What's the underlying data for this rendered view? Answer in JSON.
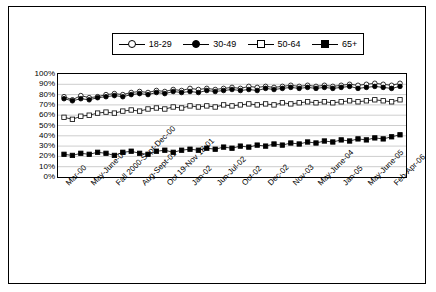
{
  "chart_data": {
    "type": "line",
    "title": "",
    "xlabel": "",
    "ylabel": "",
    "ylim": [
      0,
      100
    ],
    "ytick_labels": [
      "100%",
      "90%",
      "80%",
      "70%",
      "60%",
      "50%",
      "40%",
      "30%",
      "20%",
      "10%",
      "0%"
    ],
    "yticks": [
      100,
      90,
      80,
      70,
      60,
      50,
      40,
      30,
      20,
      10,
      0
    ],
    "grid": true,
    "legend_position": "top",
    "legend": [
      "18-29",
      "30-49",
      "50-64",
      "65+"
    ],
    "x_tick_labels": [
      "Mar-00",
      "May-June-00",
      "Fall 2000-Sept-Dec-00",
      "Aug-Sept-01",
      "Oct 19-Nov 18-01",
      "Jan-02",
      "Jun-Jul-02",
      "Oct-02",
      "Dec-02",
      "Nov-03",
      "May-June-04",
      "Jan-05",
      "May-June-05",
      "Feb-Apr-06"
    ],
    "x_tick_positions": [
      0,
      3,
      6,
      9,
      12,
      15,
      18,
      21,
      24,
      27,
      30,
      33,
      36,
      39
    ],
    "n_points": 41,
    "series": [
      {
        "name": "18-29",
        "marker": "circle-open",
        "values": [
          78,
          75,
          79,
          77,
          78,
          80,
          81,
          80,
          82,
          83,
          82,
          84,
          83,
          85,
          84,
          86,
          85,
          86,
          85,
          86,
          87,
          86,
          88,
          87,
          88,
          87,
          88,
          89,
          88,
          89,
          88,
          89,
          88,
          89,
          90,
          89,
          90,
          91,
          90,
          89,
          91
        ]
      },
      {
        "name": "30-49",
        "marker": "circle-filled",
        "values": [
          76,
          74,
          76,
          75,
          77,
          78,
          79,
          78,
          80,
          81,
          80,
          82,
          81,
          83,
          82,
          83,
          82,
          84,
          83,
          84,
          85,
          84,
          85,
          84,
          86,
          85,
          86,
          87,
          86,
          87,
          86,
          87,
          86,
          87,
          88,
          86,
          87,
          88,
          87,
          86,
          88
        ]
      },
      {
        "name": "50-64",
        "marker": "square-open",
        "values": [
          58,
          56,
          59,
          60,
          62,
          63,
          62,
          64,
          65,
          64,
          66,
          67,
          66,
          68,
          67,
          69,
          68,
          69,
          68,
          70,
          69,
          70,
          71,
          70,
          71,
          70,
          72,
          71,
          72,
          73,
          72,
          73,
          72,
          73,
          74,
          73,
          74,
          75,
          74,
          73,
          75
        ]
      },
      {
        "name": "65+",
        "marker": "square-filled",
        "values": [
          22,
          21,
          23,
          22,
          24,
          23,
          21,
          24,
          25,
          23,
          22,
          25,
          26,
          24,
          26,
          27,
          26,
          28,
          27,
          29,
          28,
          30,
          29,
          31,
          30,
          32,
          31,
          33,
          32,
          34,
          33,
          35,
          34,
          36,
          35,
          37,
          36,
          38,
          37,
          39,
          41
        ]
      }
    ]
  }
}
